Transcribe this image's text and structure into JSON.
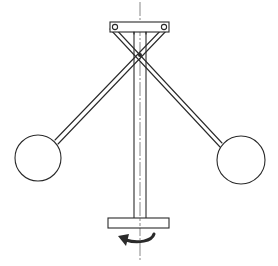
{
  "diagram": {
    "type": "mechanical-line-drawing",
    "colors": {
      "ink": "#2a2a2a",
      "background": "#ffffff"
    },
    "components": [
      {
        "id": "top-bracket",
        "shape": "rectangle",
        "x": 110,
        "y": 22,
        "w": 59,
        "h": 10
      },
      {
        "id": "vertical-shaft",
        "shape": "double-line",
        "x_left": 134,
        "x_right": 146,
        "y_top": 32,
        "y_bottom": 218
      },
      {
        "id": "rotation-axis",
        "shape": "center-line",
        "x": 140,
        "y_top": 2,
        "y_bottom": 262
      },
      {
        "id": "left-arm",
        "from": [
          114,
          27
        ],
        "to": [
          56,
          142
        ]
      },
      {
        "id": "right-arm",
        "from": [
          165,
          27
        ],
        "to": [
          224,
          145
        ]
      },
      {
        "id": "left-ball",
        "shape": "circle",
        "cx": 38,
        "cy": 158,
        "r": 23
      },
      {
        "id": "right-ball",
        "shape": "circle",
        "cx": 241,
        "cy": 160,
        "r": 24
      },
      {
        "id": "bottom-plate",
        "shape": "rectangle",
        "x": 108,
        "y": 218,
        "w": 61,
        "h": 10
      },
      {
        "id": "rotation-arrow",
        "direction": "counterclockwise-left",
        "cx": 140,
        "cy": 236
      }
    ],
    "arm_crossing_point": [
      140,
      55
    ]
  }
}
